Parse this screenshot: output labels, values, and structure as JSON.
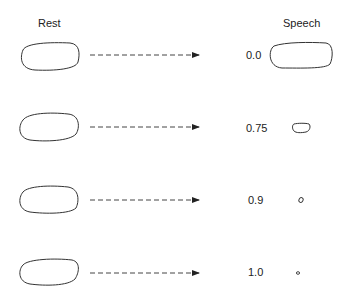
{
  "headers": {
    "rest": "Rest",
    "speech": "Speech"
  },
  "rows": [
    {
      "value": "0.0"
    },
    {
      "value": "0.75"
    },
    {
      "value": "0.9"
    },
    {
      "value": "1.0"
    }
  ],
  "colors": {
    "stroke": "#333333",
    "arrow": "#444444",
    "background": "#ffffff"
  }
}
